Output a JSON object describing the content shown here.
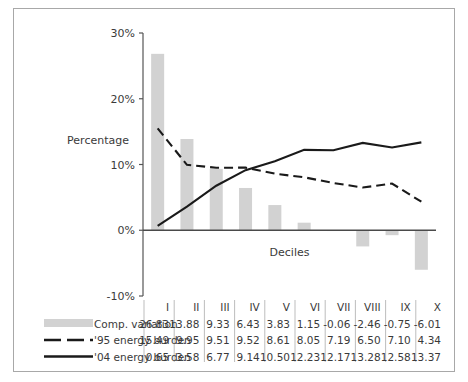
{
  "chart_data": {
    "type": "bar",
    "title": "",
    "xlabel": "Deciles",
    "ylabel": "Percentage",
    "categories": [
      "I",
      "II",
      "III",
      "IV",
      "V",
      "VI",
      "VII",
      "VIII",
      "IX",
      "X"
    ],
    "ylim": [
      -10,
      30
    ],
    "ytick_labels": [
      "30%",
      "20%",
      "10%",
      "0%",
      "-10%"
    ],
    "ytick_values": [
      30,
      20,
      10,
      0,
      -10
    ],
    "grid": false,
    "legend_position": "bottom-table",
    "series": [
      {
        "name": "Comp. variation",
        "render": "bar",
        "color": "#d2d2d2",
        "values": [
          26.83,
          13.88,
          9.33,
          6.43,
          3.83,
          1.15,
          -0.06,
          -2.46,
          -0.75,
          -6.01
        ]
      },
      {
        "name": "'95 energy burden",
        "render": "dashed-line",
        "color": "#1a1a1a",
        "values": [
          15.49,
          9.95,
          9.51,
          9.52,
          8.61,
          8.05,
          7.19,
          6.5,
          7.1,
          4.34
        ]
      },
      {
        "name": "'04 energy burden",
        "render": "solid-line",
        "color": "#1a1a1a",
        "values": [
          0.65,
          3.58,
          6.77,
          9.14,
          10.5,
          12.23,
          12.17,
          13.28,
          12.58,
          13.37
        ]
      }
    ]
  },
  "data_table": {
    "columns": [
      "I",
      "II",
      "III",
      "IV",
      "V",
      "VI",
      "VII",
      "VIII",
      "IX",
      "X"
    ],
    "rows": [
      {
        "label": "Comp. variation",
        "marker": "bar-swatch",
        "values": [
          "26.83",
          "13.88",
          "9.33",
          "6.43",
          "3.83",
          "1.15",
          "-0.06",
          "-2.46",
          "-0.75",
          "-6.01"
        ]
      },
      {
        "label": "'95 energy burden",
        "marker": "dashed-swatch",
        "values": [
          "15.49",
          "9.95",
          "9.51",
          "9.52",
          "8.61",
          "8.05",
          "7.19",
          "6.50",
          "7.10",
          "4.34"
        ]
      },
      {
        "label": "'04 energy burden",
        "marker": "solid-swatch",
        "values": [
          "0.65",
          "3.58",
          "6.77",
          "9.14",
          "10.50",
          "12.23",
          "12.17",
          "13.28",
          "12.58",
          "13.37"
        ]
      }
    ]
  },
  "colors": {
    "bar": "#d2d2d2",
    "line": "#1a1a1a",
    "axis": "#555555",
    "frame": "#a8a8a8",
    "separator": "#b5b5b5",
    "text": "#3a3a3a"
  }
}
